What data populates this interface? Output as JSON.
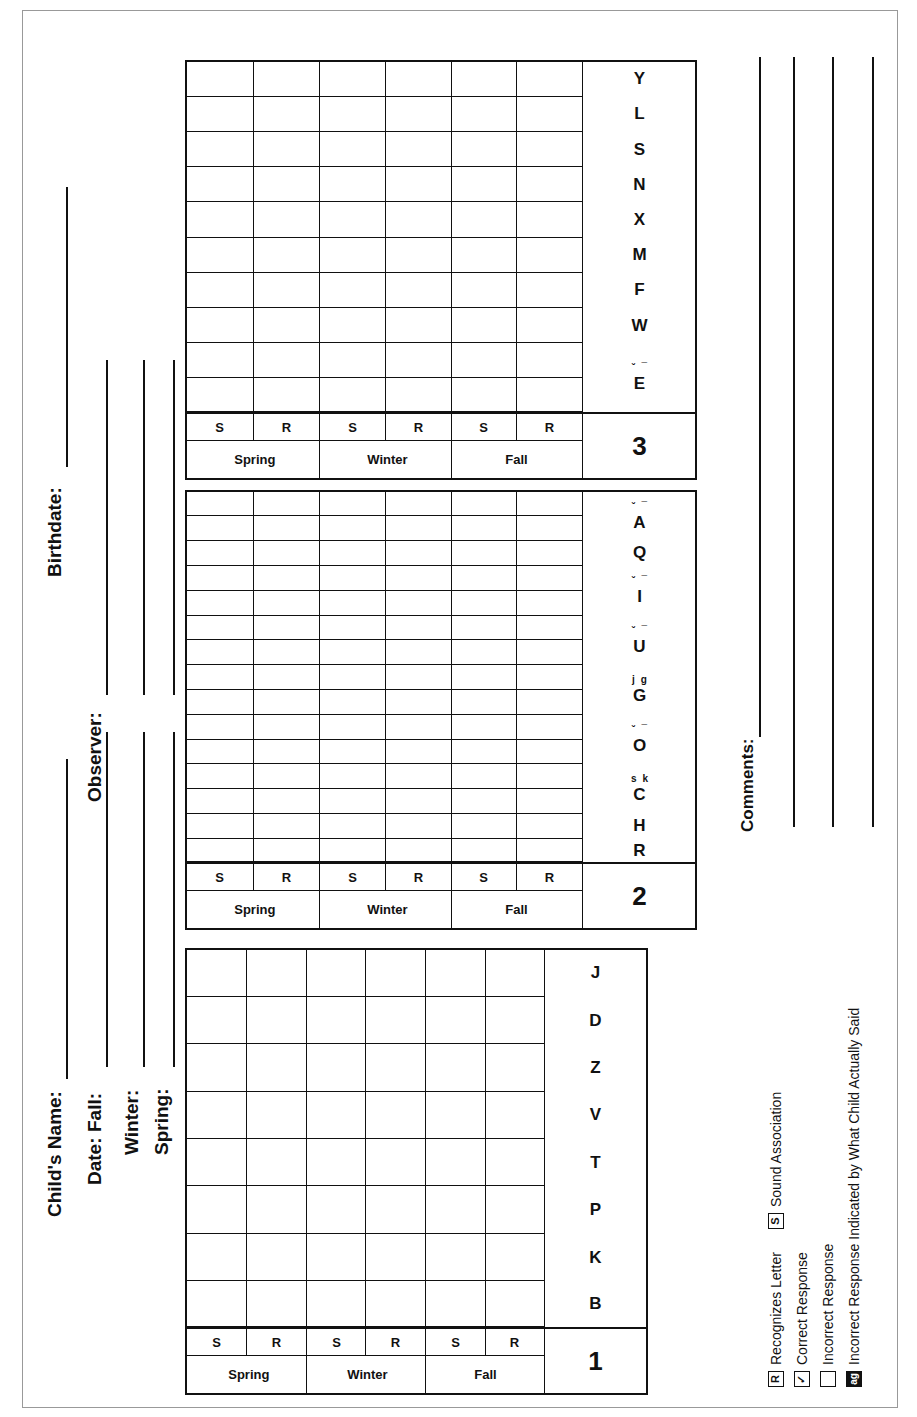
{
  "header": {
    "childs_name_label": "Child's Name:",
    "birthdate_label": "Birthdate:",
    "date_label": "Date:",
    "fall_label": "Fall:",
    "winter_label": "Winter:",
    "spring_label": "Spring:",
    "observer_label": "Observer:"
  },
  "columns": {
    "seasons": [
      "Fall",
      "Winter",
      "Spring"
    ],
    "sub": [
      "R",
      "S"
    ]
  },
  "tables": [
    {
      "number": "1",
      "letters": [
        {
          "letter": "B",
          "marks": []
        },
        {
          "letter": "K",
          "marks": []
        },
        {
          "letter": "P",
          "marks": []
        },
        {
          "letter": "T",
          "marks": []
        },
        {
          "letter": "V",
          "marks": []
        },
        {
          "letter": "Z",
          "marks": []
        },
        {
          "letter": "D",
          "marks": []
        },
        {
          "letter": "J",
          "marks": []
        }
      ]
    },
    {
      "number": "2",
      "letters": [
        {
          "letter": "R",
          "marks": []
        },
        {
          "letter": "H",
          "marks": []
        },
        {
          "letter": "C",
          "marks": [
            "s",
            "k"
          ]
        },
        {
          "letter": "O",
          "marks": [
            "˘",
            "¯"
          ]
        },
        {
          "letter": "G",
          "marks": [
            "j",
            "g"
          ]
        },
        {
          "letter": "U",
          "marks": [
            "˘",
            "¯"
          ]
        },
        {
          "letter": "I",
          "marks": [
            "˘",
            "¯"
          ]
        },
        {
          "letter": "Q",
          "marks": []
        },
        {
          "letter": "A",
          "marks": [
            "˘",
            "¯"
          ]
        }
      ]
    },
    {
      "number": "3",
      "letters": [
        {
          "letter": "E",
          "marks": [
            "˘",
            "¯"
          ]
        },
        {
          "letter": "W",
          "marks": []
        },
        {
          "letter": "F",
          "marks": []
        },
        {
          "letter": "M",
          "marks": []
        },
        {
          "letter": "X",
          "marks": []
        },
        {
          "letter": "N",
          "marks": []
        },
        {
          "letter": "S",
          "marks": []
        },
        {
          "letter": "L",
          "marks": []
        },
        {
          "letter": "Y",
          "marks": []
        }
      ]
    }
  ],
  "legend": {
    "recognizes": {
      "icon": "R",
      "label": "Recognizes Letter"
    },
    "sound": {
      "icon": "S",
      "label": "Sound Association"
    },
    "correct": {
      "icon": "✓",
      "label": "Correct Response"
    },
    "incorrect": {
      "icon": "",
      "label": "Incorrect Response"
    },
    "incorrect_indicated": {
      "icon": "ag",
      "label": "Incorrect Response Indicated by What Child Actually Said"
    }
  },
  "comments": {
    "label": "Comments:"
  }
}
